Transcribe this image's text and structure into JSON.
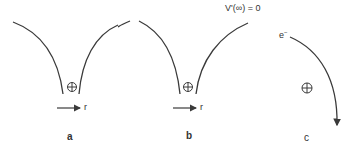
{
  "diagram": {
    "panels": [
      {
        "id": "a",
        "label": "a",
        "axis_label": "r",
        "nucleus_symbol": "⊕"
      },
      {
        "id": "b",
        "label": "b",
        "axis_label": "r",
        "nucleus_symbol": "⊕"
      },
      {
        "id": "c",
        "label": "c",
        "nucleus_symbol": "⊕",
        "electron_label": "e",
        "electron_charge": "−"
      }
    ],
    "annotation": "V'(∞) = 0",
    "colors": {
      "stroke": "#3a3a3a",
      "text": "#333333",
      "background": "#ffffff"
    }
  }
}
